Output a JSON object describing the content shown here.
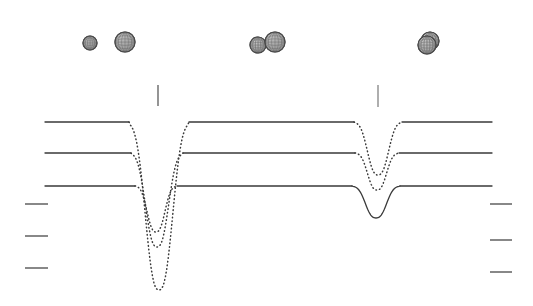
{
  "figure": {
    "type": "line-spectra-with-molecule-icons",
    "background_color": "#ffffff",
    "width": 533,
    "height": 306
  },
  "chart_data": {
    "type": "line",
    "title": "",
    "xlabel": "",
    "ylabel": "",
    "xlim": [
      0,
      533
    ],
    "ylim": [
      306,
      0
    ],
    "grid": false,
    "legend": null,
    "axis_note": "Pixel coordinates; y increases downward.",
    "series": [
      {
        "name": "trace-top",
        "baseline_y": 122,
        "stroke_color": "#3a3a3a",
        "baseline_style": "solid",
        "dip_style": "dotted",
        "x_start": 45,
        "x_end": 492,
        "dips": [
          {
            "name": "dip-left-top",
            "center_x": 159,
            "min_y": 290,
            "half_width": 26,
            "style": "dotted"
          },
          {
            "name": "dip-right-top",
            "center_x": 378,
            "min_y": 175,
            "half_width": 20,
            "style": "dotted"
          }
        ]
      },
      {
        "name": "trace-middle",
        "baseline_y": 153,
        "stroke_color": "#3a3a3a",
        "baseline_style": "solid",
        "dip_style": "dotted",
        "x_start": 45,
        "x_end": 492,
        "dips": [
          {
            "name": "dip-left-middle",
            "center_x": 157,
            "min_y": 247,
            "half_width": 22,
            "style": "dotted"
          },
          {
            "name": "dip-right-middle",
            "center_x": 377,
            "min_y": 190,
            "half_width": 18,
            "style": "dotted"
          }
        ]
      },
      {
        "name": "trace-bottom",
        "baseline_y": 186,
        "stroke_color": "#3a3a3a",
        "baseline_style": "solid",
        "dip_style": "dotted",
        "x_start": 45,
        "x_end": 492,
        "dips": [
          {
            "name": "dip-left-bottom",
            "center_x": 156,
            "min_y": 232,
            "half_width": 17,
            "style": "dotted"
          },
          {
            "name": "dip-right-bottom",
            "center_x": 376,
            "min_y": 218,
            "half_width": 20,
            "style": "solid"
          }
        ]
      }
    ],
    "markers": [
      {
        "name": "marker-tick-left",
        "x": 158,
        "y_top": 85,
        "y_bottom": 106,
        "color": "#7a7a7a"
      },
      {
        "name": "marker-tick-right",
        "x": 378,
        "y_top": 85,
        "y_bottom": 107,
        "color": "#9a9a9a"
      }
    ],
    "left_scale_ticks": [
      {
        "name": "scale-tick-left-1",
        "x1": 25,
        "x2": 48,
        "y": 204
      },
      {
        "name": "scale-tick-left-2",
        "x1": 25,
        "x2": 48,
        "y": 236
      },
      {
        "name": "scale-tick-left-3",
        "x1": 25,
        "x2": 48,
        "y": 268
      }
    ],
    "right_scale_ticks": [
      {
        "name": "scale-tick-right-1",
        "x1": 490,
        "x2": 512,
        "y": 204
      },
      {
        "name": "scale-tick-right-2",
        "x1": 490,
        "x2": 512,
        "y": 240
      },
      {
        "name": "scale-tick-right-3",
        "x1": 490,
        "x2": 512,
        "y": 272
      }
    ],
    "sphere_clusters": [
      {
        "name": "cluster-a",
        "spheres": [
          {
            "cx": 90,
            "cy": 43,
            "r": 7,
            "fill": "#9a9a9a"
          }
        ]
      },
      {
        "name": "cluster-b",
        "spheres": [
          {
            "cx": 125,
            "cy": 42,
            "r": 10,
            "fill": "#a8a8a8"
          }
        ]
      },
      {
        "name": "cluster-c",
        "spheres": [
          {
            "cx": 258,
            "cy": 45,
            "r": 8,
            "fill": "#8e8e8e"
          },
          {
            "cx": 275,
            "cy": 42,
            "r": 10,
            "fill": "#a8a8a8"
          }
        ]
      },
      {
        "name": "cluster-d",
        "spheres": [
          {
            "cx": 430,
            "cy": 41,
            "r": 9,
            "fill": "#a8a8a8"
          },
          {
            "cx": 427,
            "cy": 45,
            "r": 9,
            "fill": "#8e8e8e"
          }
        ]
      }
    ]
  },
  "colors": {
    "trace": "#3a3a3a",
    "marker_tick": "#7a7a7a",
    "scale_tick": "#555555",
    "sphere_outline": "#4a4a4a",
    "sphere_light": "#bdbdbd",
    "sphere_dark": "#8a8a8a",
    "background": "#ffffff"
  }
}
